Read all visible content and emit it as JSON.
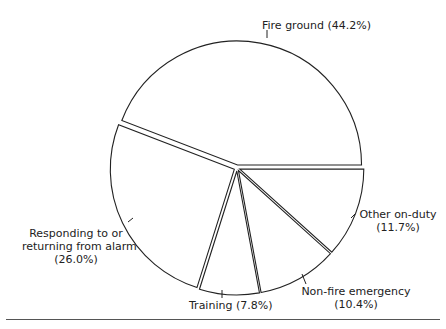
{
  "chart_data": {
    "type": "pie",
    "title": "",
    "slices": [
      {
        "label": "Fire ground",
        "value": 44.2,
        "display": "Fire ground (44.2%)"
      },
      {
        "label": "Responding to or returning from alarm",
        "value": 26.0,
        "display": "Responding to or returning from alarm (26.0%)"
      },
      {
        "label": "Training",
        "value": 7.8,
        "display": "Training (7.8%)"
      },
      {
        "label": "Non-fire emergency",
        "value": 10.4,
        "display": "Non-fire emergency (10.4%)"
      },
      {
        "label": "Other on-duty",
        "value": 11.7,
        "display": "Other on-duty (11.7%)"
      }
    ],
    "start_angle_deg": 0,
    "direction": "counterclockwise",
    "exploded": true,
    "fill": "#ffffff",
    "stroke": "#222222"
  },
  "labels": {
    "fire_ground": "Fire ground (44.2%)",
    "responding_line1": "Responding to or",
    "responding_line2": "returning from alarm",
    "responding_line3": "(26.0%)",
    "training": "Training (7.8%)",
    "nonfire_line1": "Non-fire emergency",
    "nonfire_line2": "(10.4%)",
    "other_line1": "Other on-duty",
    "other_line2": "(11.7%)"
  }
}
